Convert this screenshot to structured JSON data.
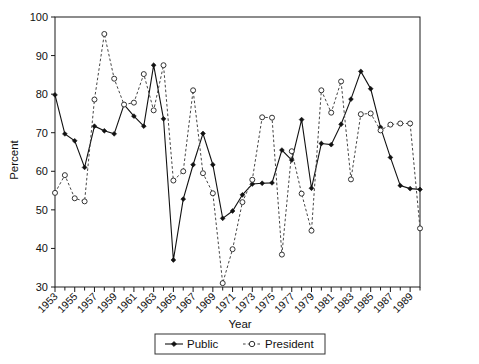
{
  "chart_data": {
    "type": "line",
    "title": "",
    "xlabel": "Year",
    "ylabel": "Percent",
    "ylim": [
      30,
      100
    ],
    "ytick_labels": [
      "30",
      "40",
      "50",
      "60",
      "70",
      "80",
      "90",
      "100"
    ],
    "yticks": [
      30,
      40,
      50,
      60,
      70,
      80,
      90,
      100
    ],
    "xlim": [
      1953,
      1990
    ],
    "xtick_labels": [
      "1953",
      "1955",
      "1957",
      "1959",
      "1961",
      "1963",
      "1965",
      "1967",
      "1969",
      "1971",
      "1973",
      "1975",
      "1977",
      "1979",
      "1981",
      "1983",
      "1985",
      "1987",
      "1989"
    ],
    "xticks_major": [
      1953,
      1955,
      1957,
      1959,
      1961,
      1963,
      1965,
      1967,
      1969,
      1971,
      1973,
      1975,
      1977,
      1979,
      1981,
      1983,
      1985,
      1987,
      1989
    ],
    "grid": false,
    "legend_position": "bottom-center",
    "x": [
      1953,
      1954,
      1955,
      1956,
      1957,
      1958,
      1959,
      1960,
      1961,
      1962,
      1963,
      1964,
      1965,
      1966,
      1967,
      1968,
      1969,
      1970,
      1971,
      1972,
      1973,
      1974,
      1975,
      1976,
      1977,
      1978,
      1979,
      1980,
      1981,
      1982,
      1983,
      1984,
      1985,
      1986,
      1987,
      1988,
      1989,
      1990
    ],
    "series": [
      {
        "name": "Public",
        "style": "solid",
        "marker": "filled-diamond",
        "color": "#111111",
        "values": [
          79.8,
          69.7,
          67.9,
          61.0,
          71.7,
          70.5,
          69.7,
          77.3,
          74.3,
          71.7,
          87.5,
          73.6,
          37.0,
          52.8,
          61.7,
          69.8,
          61.7,
          47.8,
          49.7,
          53.9,
          56.7,
          56.9,
          57.0,
          65.5,
          62.9,
          73.4,
          55.6,
          67.2,
          66.9,
          72.2,
          78.7,
          85.9,
          81.4,
          71.4,
          63.6,
          56.3,
          55.5,
          55.3
        ]
      },
      {
        "name": "President",
        "style": "dashed",
        "marker": "open-circle",
        "color": "#333333",
        "values": [
          54.4,
          59.0,
          53.0,
          52.2,
          78.6,
          95.6,
          84.0,
          77.3,
          77.8,
          85.2,
          75.8,
          87.5,
          57.6,
          60.0,
          81.0,
          59.5,
          54.3,
          31.0,
          39.8,
          52.0,
          57.8,
          74.0,
          73.9,
          38.4,
          65.2,
          54.2,
          44.6,
          81.0,
          75.2,
          83.3,
          57.9,
          74.8,
          75.0,
          70.6,
          72.1,
          72.4,
          72.4,
          45.2
        ]
      }
    ]
  },
  "legend": {
    "entries": [
      {
        "label": "Public",
        "marker": "filled-diamond"
      },
      {
        "label": "President",
        "marker": "open-circle"
      }
    ]
  }
}
